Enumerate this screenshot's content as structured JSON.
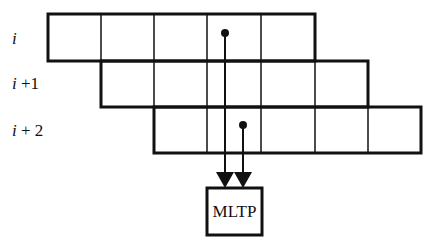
{
  "diagram": {
    "rows": [
      {
        "label_var": "i",
        "label_suffix": "",
        "x": 48,
        "y": 14,
        "cells": 5,
        "cell_w": 53.4,
        "h": 47
      },
      {
        "label_var": "i",
        "label_suffix": " +1",
        "x": 101,
        "y": 61,
        "cells": 5,
        "cell_w": 53.4,
        "h": 46
      },
      {
        "label_var": "i",
        "label_suffix": " + 2",
        "x": 154,
        "y": 107,
        "cells": 5,
        "cell_w": 53.4,
        "h": 46
      }
    ],
    "row_labels": [
      {
        "text": "i",
        "x": 12,
        "y": 44
      },
      {
        "text": "i +1",
        "x": 12,
        "y": 89
      },
      {
        "text": "i + 2",
        "x": 12,
        "y": 136
      }
    ],
    "pointers": [
      {
        "from_row": 0,
        "dot": [
          225,
          33
        ],
        "arrow_tip": [
          225,
          188
        ]
      },
      {
        "from_row": 2,
        "dot": [
          243,
          125
        ],
        "arrow_tip": [
          243,
          188
        ]
      }
    ],
    "processor": {
      "label": "MLTP",
      "x": 207,
      "y": 188,
      "w": 55,
      "h": 47
    },
    "colors": {
      "stroke": "#111111",
      "background": "#ffffff"
    }
  }
}
